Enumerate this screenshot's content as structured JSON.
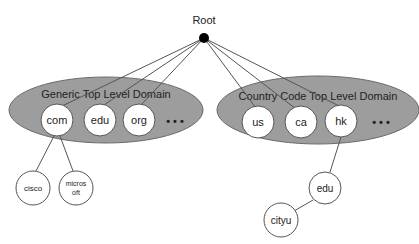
{
  "diagram": {
    "colors": {
      "ellipse_fill": "#9d9d9d",
      "ellipse_stroke": "#6a6a6a",
      "node_fill": "#ffffff",
      "edge": "#555555",
      "root_dot": "#000000"
    },
    "root": {
      "label": "Root"
    },
    "groups": [
      {
        "label": "Generic Top Level Domain",
        "nodes": [
          "com",
          "edu",
          "org"
        ],
        "ellipsis": "• • •"
      },
      {
        "label": "Country Code Top Level Domain",
        "nodes": [
          "us",
          "ca",
          "hk"
        ],
        "ellipsis": "• • •"
      }
    ],
    "subdomains": [
      {
        "parent": "com",
        "label_lines": [
          "cisco"
        ]
      },
      {
        "parent": "com",
        "label_lines": [
          "micros",
          "oft"
        ]
      },
      {
        "parent": "hk",
        "label_lines": [
          "edu"
        ]
      },
      {
        "parent": "hk.edu",
        "label_lines": [
          "cityu"
        ]
      }
    ]
  }
}
